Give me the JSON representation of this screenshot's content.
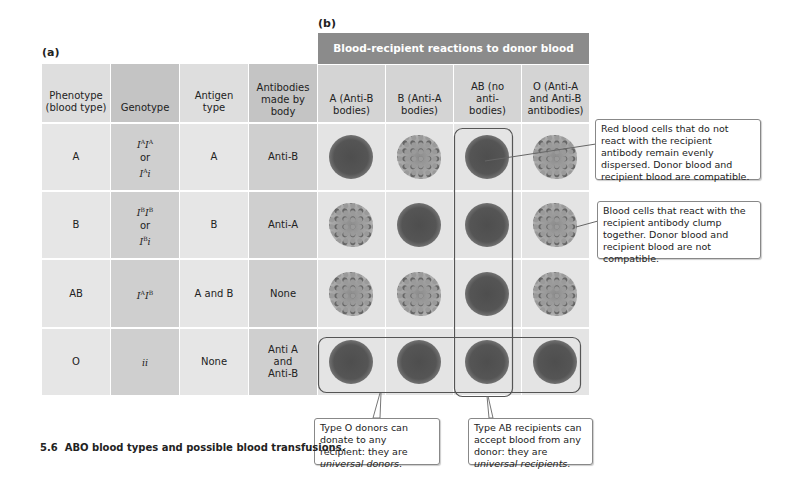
{
  "panel_a": {
    "label": "(a)",
    "headers": [
      "Phenotype (blood type)",
      "Genotype",
      "Antigen type",
      "Antibodies made by body"
    ],
    "rows": [
      {
        "phenotype": "A",
        "genotype": [
          "IAIA",
          "or",
          "IAi"
        ],
        "antigen": "A",
        "antibodies": "Anti-B"
      },
      {
        "phenotype": "B",
        "genotype": [
          "IBIB",
          "or",
          "IBi"
        ],
        "antigen": "B",
        "antibodies": "Anti-A"
      },
      {
        "phenotype": "AB",
        "genotype": [
          "IAIB"
        ],
        "antigen": "A and B",
        "antibodies": "None"
      },
      {
        "phenotype": "O",
        "genotype": [
          "ii"
        ],
        "antigen": "None",
        "antibodies": "Anti A and Anti-B"
      }
    ]
  },
  "panel_b": {
    "label": "(b)",
    "banner": "Blood-recipient reactions to donor blood",
    "headers": [
      "A (Anti-B bodies)",
      "B (Anti-A bodies)",
      "AB (no anti-bodies)",
      "O (Anti-A and Anti-B antibodies)"
    ],
    "reactions": [
      [
        "dispersed",
        "clumped",
        "dispersed",
        "clumped"
      ],
      [
        "clumped",
        "dispersed",
        "dispersed",
        "clumped"
      ],
      [
        "clumped",
        "clumped",
        "dispersed",
        "clumped"
      ],
      [
        "dispersed",
        "dispersed",
        "dispersed",
        "dispersed"
      ]
    ]
  },
  "callouts": {
    "compatible": "Red blood cells that do not react with the recipient antibody remain evenly dispersed. Donor blood and recipient blood are compatible.",
    "incompatible": "Blood cells that react with the recipient antibody clump together. Donor blood and recipient blood are not compatible.",
    "universal_donor_prefix": "Type O donors can donate to any recipient: they are ",
    "universal_donor_em": "universal donors",
    "universal_recipient_prefix": "Type AB recipients can accept blood from any donor: they are ",
    "universal_recipient_em": "universal recipients"
  },
  "caption": {
    "number": "5.6",
    "text": "ABO blood types and possible blood transfusions."
  },
  "colors": {
    "banner": "#8b8b8b",
    "light_cell": "#e6e6e6",
    "mid_cell": "#cfcfcf"
  }
}
